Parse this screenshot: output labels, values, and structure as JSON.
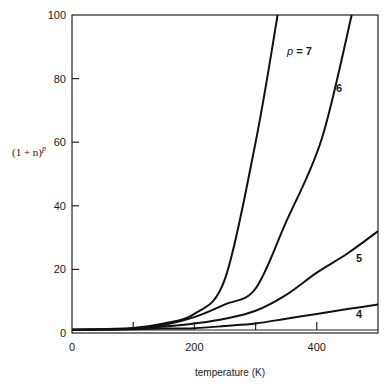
{
  "chart_data": {
    "type": "line",
    "title": "",
    "xlabel": "temperature (K)",
    "ylabel": "(1 + n)^p",
    "ylabel_base": "(1 + n)",
    "ylabel_exp": "p",
    "xlim": [
      0,
      500
    ],
    "ylim": [
      0,
      100
    ],
    "grid": false,
    "legend": "inline curve labels",
    "x_ticks": [
      0,
      100,
      200,
      300,
      400,
      500
    ],
    "x_tick_labels": [
      "0",
      "",
      "200",
      "",
      "400",
      ""
    ],
    "y_ticks": [
      0,
      20,
      40,
      60,
      80,
      100
    ],
    "y_tick_labels": [
      "0",
      "20",
      "40",
      "60",
      "80",
      "100"
    ],
    "series": [
      {
        "name": "p = 7",
        "label": "p = 7",
        "x": [
          0,
          100,
          150,
          200,
          250,
          300,
          336
        ],
        "values": [
          1,
          1.6,
          3,
          6,
          17,
          60,
          100
        ]
      },
      {
        "name": "6",
        "label": "6",
        "x": [
          0,
          100,
          150,
          200,
          250,
          300,
          350,
          408,
          457
        ],
        "values": [
          1,
          1.4,
          2.5,
          5,
          9,
          14,
          35,
          61,
          100
        ]
      },
      {
        "name": "5",
        "label": "5",
        "x": [
          0,
          100,
          150,
          200,
          250,
          300,
          350,
          400,
          450,
          500
        ],
        "values": [
          1,
          1.3,
          2,
          3,
          4.5,
          7,
          12,
          19,
          25,
          32
        ]
      },
      {
        "name": "4",
        "label": "4",
        "x": [
          0,
          100,
          150,
          200,
          250,
          300,
          350,
          400,
          450,
          500
        ],
        "values": [
          1,
          1.2,
          1.4,
          1.5,
          2.2,
          3,
          4.5,
          6,
          7.5,
          9
        ]
      }
    ]
  }
}
